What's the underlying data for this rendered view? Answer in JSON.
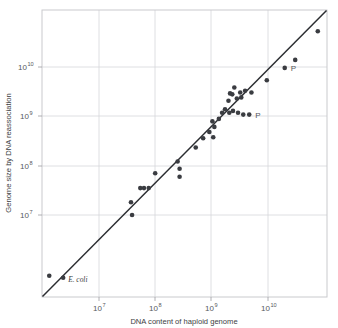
{
  "chart_data": {
    "type": "scatter",
    "title": "",
    "xlabel": "DNA content of haploid genome",
    "ylabel": "Genome size by DNA reassociation",
    "xscale": "log",
    "yscale": "log",
    "xlim": [
      2000000,
      60000000000
    ],
    "ylim": [
      2000000,
      60000000000
    ],
    "xtick_labels": [
      "10",
      "10",
      "10",
      "10"
    ],
    "xtick_exponents": [
      "7",
      "8",
      "9",
      "10"
    ],
    "xtick_values": [
      10000000,
      100000000,
      1000000000,
      10000000000
    ],
    "ytick_labels": [
      "10",
      "10",
      "10",
      "10"
    ],
    "ytick_exponents": [
      "7",
      "8",
      "9",
      "10"
    ],
    "ytick_values": [
      10000000,
      100000000,
      1000000000,
      10000000000
    ],
    "grid": true,
    "legend": "none",
    "marker_color": "#3a3c41",
    "line_color": "#2b2d31",
    "grid_color": "#d6d7da",
    "frame_color": "#c9cacd",
    "reference_line": {
      "description": "1:1 diagonal identity line",
      "x": [
        2000000,
        60000000000
      ],
      "y": [
        2000000,
        60000000000
      ]
    },
    "points": [
      {
        "x": 2600000.0,
        "y": 4300000.0
      },
      {
        "x": 4300000.0,
        "y": 4000000.0,
        "label": "E. coli"
      },
      {
        "x": 50000000.0,
        "y": 60000000.0
      },
      {
        "x": 52000000.0,
        "y": 38000000.0
      },
      {
        "x": 70000000.0,
        "y": 100000000.0
      },
      {
        "x": 80000000.0,
        "y": 100000000.0
      },
      {
        "x": 95000000.0,
        "y": 100000000.0
      },
      {
        "x": 120000000.0,
        "y": 170000000.0
      },
      {
        "x": 290000000.0,
        "y": 200000000.0
      },
      {
        "x": 290000000.0,
        "y": 150000000.0
      },
      {
        "x": 270000000.0,
        "y": 260000000.0
      },
      {
        "x": 520000000.0,
        "y": 430000000.0
      },
      {
        "x": 680000000.0,
        "y": 600000000.0
      },
      {
        "x": 850000000.0,
        "y": 750000000.0
      },
      {
        "x": 950000000.0,
        "y": 1100000000.0
      },
      {
        "x": 980000000.0,
        "y": 620000000.0
      },
      {
        "x": 1020000000.0,
        "y": 900000000.0
      },
      {
        "x": 1200000000.0,
        "y": 1200000000.0
      },
      {
        "x": 1350000000.0,
        "y": 1500000000.0
      },
      {
        "x": 1500000000.0,
        "y": 1700000000.0
      },
      {
        "x": 1700000000.0,
        "y": 2300000000.0
      },
      {
        "x": 1750000000.0,
        "y": 1500000000.0
      },
      {
        "x": 1800000000.0,
        "y": 3000000000.0
      },
      {
        "x": 1950000000.0,
        "y": 2900000000.0
      },
      {
        "x": 2000000000.0,
        "y": 1600000000.0
      },
      {
        "x": 2100000000.0,
        "y": 3700000000.0
      },
      {
        "x": 2300000000.0,
        "y": 2500000000.0
      },
      {
        "x": 2400000000.0,
        "y": 1500000000.0
      },
      {
        "x": 2600000000.0,
        "y": 3100000000.0
      },
      {
        "x": 2700000000.0,
        "y": 2600000000.0
      },
      {
        "x": 2900000000.0,
        "y": 1400000000.0
      },
      {
        "x": 3100000000.0,
        "y": 3300000000.0
      },
      {
        "x": 3600000000.0,
        "y": 1400000000.0,
        "label": "P"
      },
      {
        "x": 3900000000.0,
        "y": 3100000000.0
      },
      {
        "x": 6800000000.0,
        "y": 4800000000.0
      },
      {
        "x": 13000000000.0,
        "y": 7500000000.0,
        "label": "P"
      },
      {
        "x": 19000000000.0,
        "y": 10000000000.0
      },
      {
        "x": 43000000000.0,
        "y": 28000000000.0
      }
    ],
    "annotations": [
      {
        "text": "E. coli",
        "style": "italic-serif"
      },
      {
        "text": "P",
        "style": "upright"
      },
      {
        "text": "P",
        "style": "upright"
      }
    ]
  }
}
